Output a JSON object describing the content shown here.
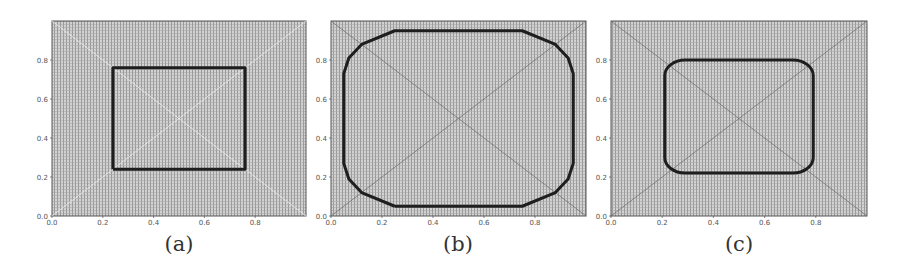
{
  "figure": {
    "panels": [
      {
        "id": "a",
        "caption": "(a)"
      },
      {
        "id": "b",
        "caption": "(b)"
      },
      {
        "id": "c",
        "caption": "(c)"
      }
    ]
  },
  "chart_data": [
    {
      "type": "line",
      "title": "(a)",
      "xlabel": "",
      "ylabel": "",
      "xlim": [
        0,
        1
      ],
      "ylim": [
        0,
        1
      ],
      "xticks": [
        "0.0",
        "0.2",
        "0.4",
        "0.6",
        "0.8"
      ],
      "yticks": [
        "0.0",
        "0.2",
        "0.4",
        "0.6",
        "0.8"
      ],
      "background": "dense grey mesh with faint white diagonals",
      "diagonals": [
        [
          [
            0,
            0
          ],
          [
            1,
            1
          ]
        ],
        [
          [
            0,
            1
          ],
          [
            1,
            0
          ]
        ]
      ],
      "shape": "square",
      "series": [
        {
          "name": "contour",
          "x": [
            0.24,
            0.76,
            0.76,
            0.24,
            0.24
          ],
          "y": [
            0.24,
            0.24,
            0.76,
            0.76,
            0.24
          ]
        }
      ]
    },
    {
      "type": "line",
      "title": "(b)",
      "xlabel": "",
      "ylabel": "",
      "xlim": [
        0,
        1
      ],
      "ylim": [
        0,
        1
      ],
      "xticks": [
        "0.0",
        "0.2",
        "0.4",
        "0.6",
        "0.8"
      ],
      "yticks": [
        "0.0",
        "0.2",
        "0.4",
        "0.6",
        "0.8"
      ],
      "background": "dense grey mesh with dark diagonals",
      "diagonals": [
        [
          [
            0,
            0
          ],
          [
            1,
            1
          ]
        ],
        [
          [
            0,
            1
          ],
          [
            1,
            0
          ]
        ]
      ],
      "shape": "chamfered rounded rectangle",
      "series": [
        {
          "name": "contour",
          "x": [
            0.25,
            0.75,
            0.88,
            0.93,
            0.95,
            0.95,
            0.93,
            0.88,
            0.75,
            0.25,
            0.12,
            0.07,
            0.05,
            0.05,
            0.07,
            0.12,
            0.25
          ],
          "y": [
            0.05,
            0.05,
            0.12,
            0.19,
            0.27,
            0.73,
            0.81,
            0.88,
            0.95,
            0.95,
            0.88,
            0.81,
            0.73,
            0.27,
            0.19,
            0.12,
            0.05
          ]
        }
      ]
    },
    {
      "type": "line",
      "title": "(c)",
      "xlabel": "",
      "ylabel": "",
      "xlim": [
        0,
        1
      ],
      "ylim": [
        0,
        1
      ],
      "xticks": [
        "0.0",
        "0.2",
        "0.4",
        "0.6",
        "0.8"
      ],
      "yticks": [
        "0.0",
        "0.2",
        "0.4",
        "0.6",
        "0.8"
      ],
      "background": "dense grey mesh with dark diagonals",
      "diagonals": [
        [
          [
            0,
            0
          ],
          [
            1,
            1
          ]
        ],
        [
          [
            0,
            1
          ],
          [
            1,
            0
          ]
        ]
      ],
      "shape": "rounded rectangle",
      "series": [
        {
          "name": "contour",
          "x_range": [
            0.21,
            0.79
          ],
          "y_range": [
            0.22,
            0.8
          ],
          "corner_radius": 0.08
        }
      ]
    }
  ]
}
